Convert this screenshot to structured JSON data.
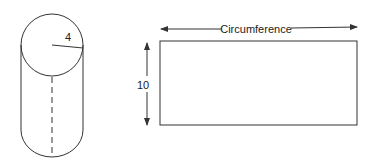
{
  "cylinder": {
    "radius_label": "4"
  },
  "rectangle": {
    "width_label": "Circumference",
    "height_label": "10"
  },
  "colors": {
    "stroke": "#333333",
    "background": "#ffffff"
  }
}
